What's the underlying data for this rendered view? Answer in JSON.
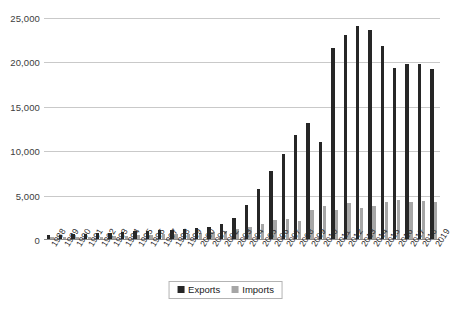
{
  "chart_data": {
    "type": "bar",
    "title": "",
    "subtitle": "",
    "xlabel": "",
    "ylabel": "",
    "ylim": [
      0,
      25000
    ],
    "yticks": [
      "0",
      "5,000",
      "10,000",
      "15,000",
      "20,000",
      "25,000"
    ],
    "ytick_values": [
      0,
      5000,
      10000,
      15000,
      20000,
      25000
    ],
    "grid": "horizontal",
    "legend_position": "bottom-center",
    "categories": [
      "1988",
      "1989",
      "1990",
      "1991",
      "1992",
      "1993",
      "1994",
      "1995",
      "1996",
      "1997",
      "1998",
      "1999",
      "2000",
      "2001",
      "2002",
      "2003",
      "2004",
      "2005",
      "2006",
      "2007",
      "2008",
      "2009",
      "2010",
      "2011",
      "2012",
      "2013",
      "2014",
      "2015",
      "2016",
      "2017",
      "2018",
      "2019"
    ],
    "series": [
      {
        "name": "Exports",
        "color": "#262626",
        "values": [
          420,
          470,
          520,
          560,
          640,
          700,
          760,
          860,
          900,
          1000,
          1060,
          1150,
          1250,
          1400,
          1700,
          2350,
          3850,
          5650,
          7750,
          9600,
          11800,
          13150,
          10950,
          21650,
          23100,
          24050,
          23600,
          21800,
          19400,
          19750,
          19800,
          19250
        ]
      },
      {
        "name": "Imports",
        "color": "#a6a6a6",
        "values": [
          180,
          200,
          230,
          250,
          280,
          310,
          340,
          400,
          450,
          520,
          560,
          620,
          700,
          780,
          900,
          1100,
          1350,
          1700,
          2100,
          2300,
          2000,
          3250,
          3750,
          3250,
          4050,
          3550,
          3750,
          4200,
          4400,
          4150,
          4250,
          4200
        ]
      }
    ]
  },
  "legend": {
    "items": [
      {
        "label": "Exports",
        "color": "#262626"
      },
      {
        "label": "Imports",
        "color": "#a6a6a6"
      }
    ]
  }
}
